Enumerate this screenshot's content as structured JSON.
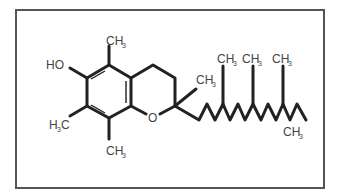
{
  "figure": {
    "title": "",
    "molecule": "alpha-tocopherol skeletal structure",
    "colors": {
      "bond": "#222222",
      "label": "#444444",
      "frame": "#555555",
      "background": "#ffffff"
    },
    "labels": {
      "hydroxyl": "HO",
      "oxygen": "O",
      "methyl_top_main": "CH",
      "methyl_top_sub": "3",
      "methyl_left_main": "H",
      "methyl_left_sub": "3",
      "methyl_left_tail": "C",
      "methyl_bottom_main": "CH",
      "methyl_bottom_sub": "3",
      "methyl_c2_main": "CH",
      "methyl_c2_sub": "3",
      "chain_methyl_1_main": "CH",
      "chain_methyl_1_sub": "3",
      "chain_methyl_2_main": "CH",
      "chain_methyl_2_sub": "3",
      "chain_methyl_3_main": "CH",
      "chain_methyl_3_sub": "3",
      "terminal_methyl_main": "CH",
      "terminal_methyl_sub": "3"
    }
  }
}
